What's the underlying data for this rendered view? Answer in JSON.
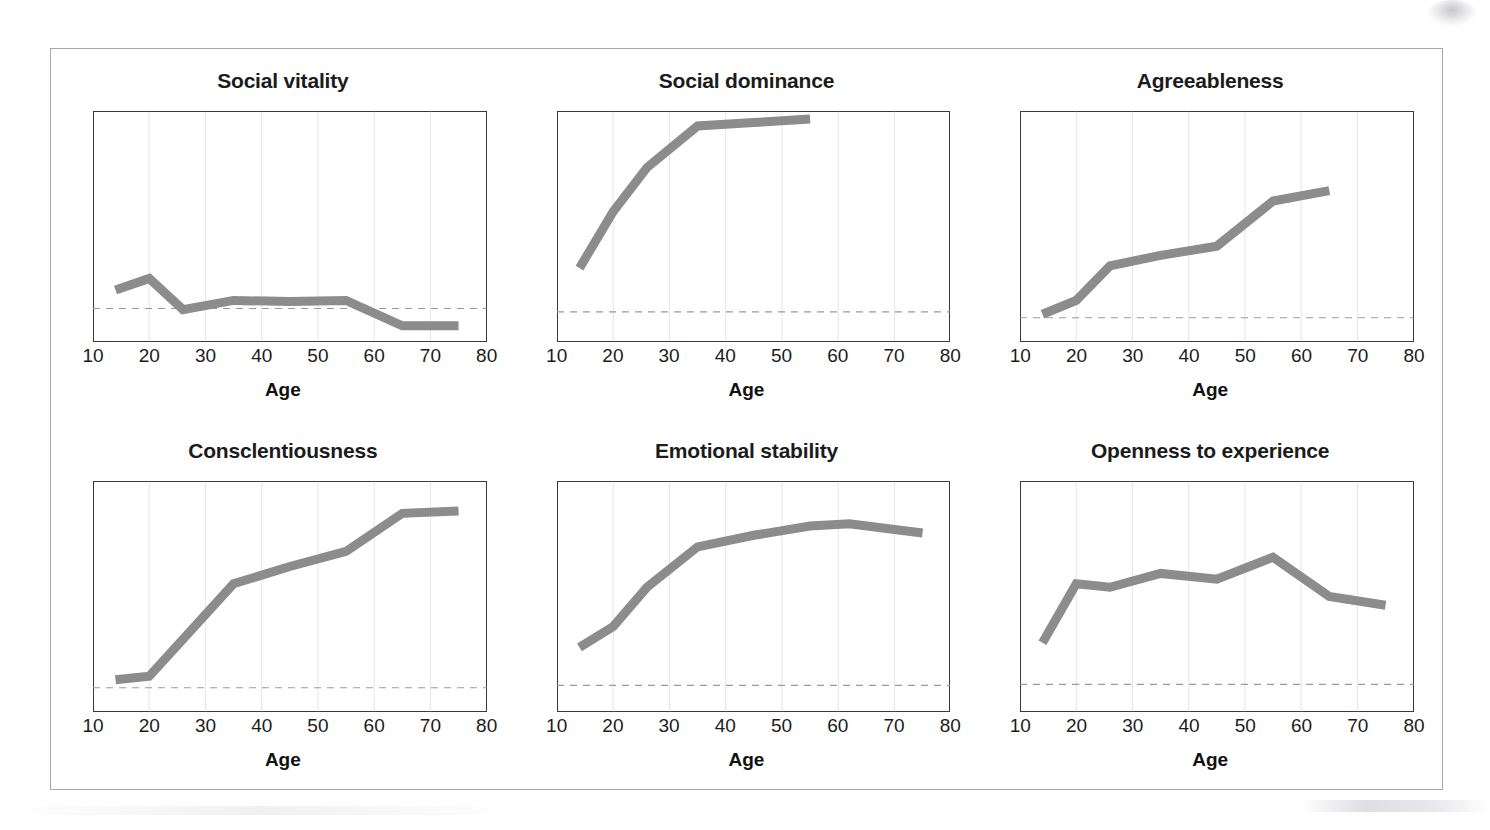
{
  "figure": {
    "x_axis_label": "Age",
    "x_ticks": [
      10,
      20,
      30,
      40,
      50,
      60,
      70,
      80
    ],
    "x_min": 10,
    "x_max": 80,
    "line_color": "#8c8c8c",
    "baseline_color": "#9a9a9a",
    "gridline_color": "#b3b3b3",
    "box_color": "#3a3a3a"
  },
  "chart_data": [
    {
      "type": "line",
      "title": "Social vitality",
      "xlabel": "Age",
      "ylabel": "",
      "xlim": [
        10,
        80
      ],
      "ylim": [
        0,
        1
      ],
      "grid": true,
      "gridlines_x": [
        20,
        30,
        40,
        50,
        60,
        70
      ],
      "baseline_y": 0.145,
      "x": [
        14,
        20,
        26,
        35,
        45,
        55,
        65,
        75
      ],
      "values": [
        0.225,
        0.275,
        0.14,
        0.18,
        0.175,
        0.18,
        0.07,
        0.07
      ]
    },
    {
      "type": "line",
      "title": "Social dominance",
      "xlabel": "Age",
      "ylabel": "",
      "xlim": [
        10,
        80
      ],
      "ylim": [
        0,
        1
      ],
      "grid": true,
      "gridlines_x": [
        20,
        30,
        40,
        50,
        60,
        70
      ],
      "baseline_y": 0.13,
      "x": [
        14,
        20,
        26,
        35,
        45,
        55
      ],
      "values": [
        0.32,
        0.565,
        0.755,
        0.935,
        0.95,
        0.965
      ]
    },
    {
      "type": "line",
      "title": "Agreeableness",
      "xlabel": "Age",
      "ylabel": "",
      "xlim": [
        10,
        80
      ],
      "ylim": [
        0,
        1
      ],
      "grid": true,
      "gridlines_x": [
        20,
        30,
        40,
        50,
        60,
        70
      ],
      "baseline_y": 0.105,
      "x": [
        14,
        20,
        26,
        35,
        45,
        55,
        65
      ],
      "values": [
        0.12,
        0.18,
        0.33,
        0.375,
        0.415,
        0.61,
        0.655
      ]
    },
    {
      "type": "line",
      "title": "Consclentiousness",
      "xlabel": "Age",
      "ylabel": "",
      "xlim": [
        10,
        80
      ],
      "ylim": [
        0,
        1
      ],
      "grid": true,
      "gridlines_x": [
        20,
        30,
        40,
        50,
        60,
        70
      ],
      "baseline_y": 0.105,
      "x": [
        14,
        20,
        35,
        45,
        55,
        65,
        75
      ],
      "values": [
        0.14,
        0.155,
        0.555,
        0.63,
        0.695,
        0.86,
        0.87
      ]
    },
    {
      "type": "line",
      "title": "Emotional stability",
      "xlabel": "Age",
      "ylabel": "",
      "xlim": [
        10,
        80
      ],
      "ylim": [
        0,
        1
      ],
      "grid": true,
      "gridlines_x": [
        20,
        30,
        40,
        50,
        60,
        70
      ],
      "baseline_y": 0.115,
      "x": [
        14,
        20,
        26,
        35,
        45,
        55,
        62,
        70,
        75
      ],
      "values": [
        0.28,
        0.37,
        0.54,
        0.715,
        0.765,
        0.805,
        0.815,
        0.79,
        0.775
      ]
    },
    {
      "type": "line",
      "title": "Openness to experience",
      "xlabel": "Age",
      "ylabel": "",
      "xlim": [
        10,
        80
      ],
      "ylim": [
        0,
        1
      ],
      "grid": true,
      "gridlines_x": [
        20,
        30,
        40,
        50,
        60,
        70
      ],
      "baseline_y": 0.12,
      "x": [
        14,
        20,
        26,
        35,
        45,
        55,
        65,
        75
      ],
      "values": [
        0.3,
        0.555,
        0.54,
        0.6,
        0.575,
        0.67,
        0.5,
        0.462
      ]
    }
  ]
}
